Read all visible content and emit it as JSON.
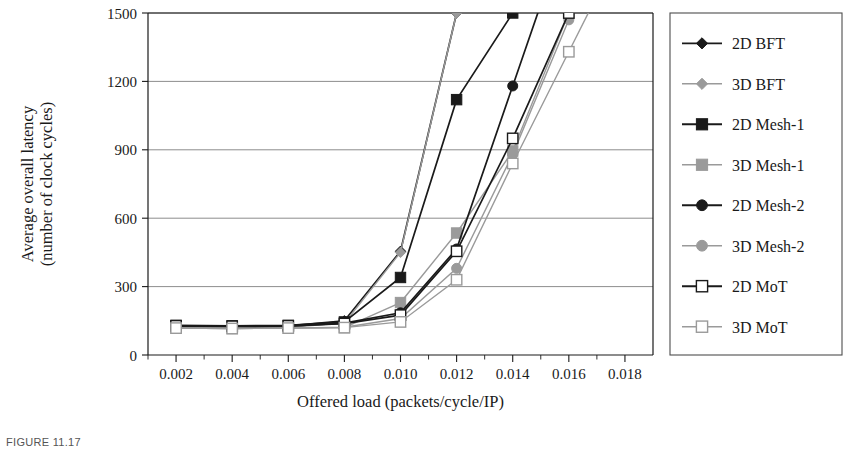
{
  "figure": {
    "caption": "FIGURE 11.17",
    "background": "#ffffff"
  },
  "colors": {
    "series_2d": "#1a1a1a",
    "series_3d": "#9a9a9a",
    "axis": "#1a1a1a",
    "grid": "#808080",
    "legend_border": "#4d4d4d",
    "text": "#1a1a1a"
  },
  "axes": {
    "y_title_line1": "Average overall latency",
    "y_title_line2": "(number of clock cycles)",
    "x_title": "Offered load (packets/cycle/IP)",
    "y_ticks": [
      "0",
      "300",
      "600",
      "900",
      "1200",
      "1500"
    ],
    "x_ticks": [
      "0.002",
      "0.004",
      "0.006",
      "0.008",
      "0.010",
      "0.012",
      "0.014",
      "0.016",
      "0.018"
    ]
  },
  "legend": {
    "items": [
      {
        "label": "2D BFT",
        "marker": "diamond-filled",
        "color": "#1a1a1a"
      },
      {
        "label": "3D BFT",
        "marker": "diamond-filled",
        "color": "#9a9a9a"
      },
      {
        "label": "2D Mesh-1",
        "marker": "square-filled",
        "color": "#1a1a1a"
      },
      {
        "label": "3D Mesh-1",
        "marker": "square-filled",
        "color": "#9a9a9a"
      },
      {
        "label": "2D Mesh-2",
        "marker": "circle-filled",
        "color": "#1a1a1a"
      },
      {
        "label": "3D Mesh-2",
        "marker": "circle-filled",
        "color": "#9a9a9a"
      },
      {
        "label": "2D MoT",
        "marker": "square-open",
        "color": "#1a1a1a"
      },
      {
        "label": "3D MoT",
        "marker": "square-open",
        "color": "#9a9a9a"
      }
    ]
  },
  "chart_data": {
    "type": "line",
    "title": "",
    "xlabel": "Offered load (packets/cycle/IP)",
    "ylabel": "Average overall latency (number of clock cycles)",
    "xlim": [
      0.001,
      0.019
    ],
    "ylim": [
      0,
      1500
    ],
    "xticks": [
      0.002,
      0.004,
      0.006,
      0.008,
      0.01,
      0.012,
      0.014,
      0.016,
      0.018
    ],
    "yticks": [
      0,
      300,
      600,
      900,
      1200,
      1500
    ],
    "grid": "horizontal",
    "legend_position": "right-outside",
    "series": [
      {
        "name": "2D BFT",
        "color": "#1a1a1a",
        "marker": "diamond-filled",
        "x": [
          0.002,
          0.004,
          0.006,
          0.008,
          0.01,
          0.012
        ],
        "y": [
          128,
          126,
          128,
          150,
          455,
          1500
        ]
      },
      {
        "name": "3D BFT",
        "color": "#9a9a9a",
        "marker": "diamond-filled",
        "x": [
          0.002,
          0.004,
          0.006,
          0.008,
          0.01,
          0.012
        ],
        "y": [
          120,
          118,
          122,
          140,
          450,
          1500
        ]
      },
      {
        "name": "2D Mesh-1",
        "color": "#1a1a1a",
        "marker": "square-filled",
        "x": [
          0.002,
          0.004,
          0.006,
          0.008,
          0.01,
          0.012,
          0.014
        ],
        "y": [
          130,
          128,
          130,
          145,
          340,
          1120,
          1500
        ]
      },
      {
        "name": "3D Mesh-1",
        "color": "#9a9a9a",
        "marker": "square-filled",
        "x": [
          0.002,
          0.004,
          0.006,
          0.008,
          0.01,
          0.012,
          0.014,
          0.016
        ],
        "y": [
          118,
          116,
          118,
          120,
          230,
          535,
          895,
          1500
        ]
      },
      {
        "name": "2D Mesh-2",
        "color": "#1a1a1a",
        "marker": "circle-filled",
        "x": [
          0.002,
          0.004,
          0.006,
          0.008,
          0.01,
          0.012,
          0.014
        ],
        "y": [
          126,
          124,
          126,
          140,
          185,
          465,
          1180
        ]
      },
      {
        "name": "3D Mesh-2",
        "color": "#9a9a9a",
        "marker": "circle-filled",
        "x": [
          0.002,
          0.004,
          0.006,
          0.008,
          0.01,
          0.012,
          0.014,
          0.016
        ],
        "y": [
          118,
          116,
          118,
          122,
          160,
          380,
          880,
          1470
        ]
      },
      {
        "name": "2D MoT",
        "color": "#1a1a1a",
        "marker": "square-open",
        "x": [
          0.002,
          0.004,
          0.006,
          0.008,
          0.01,
          0.012,
          0.014,
          0.016
        ],
        "y": [
          128,
          126,
          128,
          138,
          175,
          455,
          950,
          1500
        ]
      },
      {
        "name": "3D MoT",
        "color": "#9a9a9a",
        "marker": "square-open",
        "x": [
          0.002,
          0.004,
          0.006,
          0.008,
          0.01,
          0.012,
          0.014,
          0.016
        ],
        "y": [
          118,
          116,
          118,
          120,
          145,
          330,
          840,
          1330
        ]
      }
    ]
  }
}
